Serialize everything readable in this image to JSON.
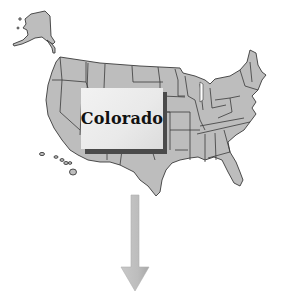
{
  "diagram": {
    "type": "us-state-map-callout",
    "highlighted_state": {
      "label": "Colorado"
    },
    "map_fill_color": "#bdbdbd",
    "border_color": "#3a3a3a",
    "callout_background": "#ececec",
    "callout_shadow": "#4a4a4a",
    "arrow": {
      "direction": "down",
      "color": "#bcbcbc"
    }
  }
}
